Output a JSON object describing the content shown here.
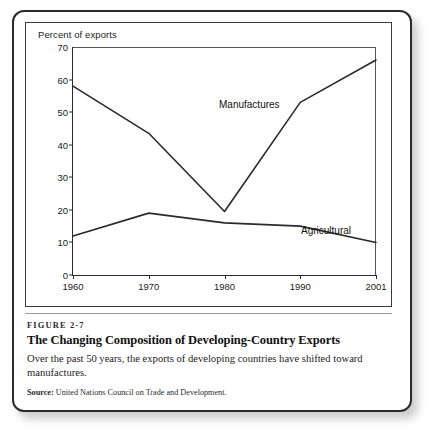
{
  "figure": {
    "number_label": "FIGURE 2-7",
    "title": "The Changing Composition of Developing-Country Exports",
    "description": "Over the past 50 years, the exports of developing countries have shifted toward manufactures.",
    "source_label": "Source:",
    "source_text": "United Nations Council on Trade and Development."
  },
  "chart_data": {
    "type": "line",
    "title": "",
    "ylabel": "Percent of exports",
    "xlabel": "",
    "x": [
      "1960",
      "1970",
      "1980",
      "1990",
      "2001"
    ],
    "categories": [
      "1960",
      "1970",
      "1980",
      "1990",
      "2001"
    ],
    "series": [
      {
        "name": "Manufactures",
        "values": [
          58,
          43.5,
          19.5,
          53,
          66
        ]
      },
      {
        "name": "Agricultural",
        "values": [
          12,
          19,
          16,
          15,
          10
        ]
      }
    ],
    "ylim": [
      0,
      70
    ],
    "yticks": [
      0,
      10,
      20,
      30,
      40,
      50,
      60,
      70
    ],
    "ytick_labels": [
      "0",
      "10",
      "20",
      "30",
      "40",
      "50",
      "60",
      "70"
    ],
    "xtick_labels": [
      "1960",
      "1970",
      "1980",
      "1990",
      "2001"
    ],
    "grid": false,
    "legend_position": "inline-annotations",
    "line_color": "#2a2a2a"
  }
}
